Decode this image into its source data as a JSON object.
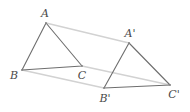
{
  "figure": {
    "background_color": "#ffffff",
    "triangle_stroke_color": "#6e6e6e",
    "vector_stroke_color": "#d2d2d2",
    "vertex_dot_color": "#8a8a8a",
    "label_color": "#4a4a4a",
    "triangle_stroke_width": 1.1,
    "vector_stroke_width": 1.4
  },
  "chart_data": {
    "type": "scatter",
    "xlabel": "",
    "ylabel": "",
    "xlim": [
      0,
      190
    ],
    "ylim": [
      0,
      112
    ],
    "grid": false,
    "legend": "none",
    "series": [
      {
        "name": "Triangle ABC",
        "points": [
          {
            "label": "A",
            "x": 46,
            "y": 23
          },
          {
            "label": "B",
            "x": 22,
            "y": 70
          },
          {
            "label": "C",
            "x": 82,
            "y": 66
          }
        ]
      },
      {
        "name": "Triangle A'B'C'",
        "points": [
          {
            "label": "A'",
            "x": 129,
            "y": 43
          },
          {
            "label": "B'",
            "x": 104,
            "y": 88
          },
          {
            "label": "C'",
            "x": 170,
            "y": 85
          }
        ]
      }
    ],
    "annotations": [
      {
        "name": "translation-vector-A",
        "from": "A",
        "to": "A'"
      },
      {
        "name": "translation-vector-B",
        "from": "B",
        "to": "B'"
      },
      {
        "name": "translation-vector-C",
        "from": "C",
        "to": "C'"
      }
    ]
  },
  "labels": {
    "a": "A",
    "b": "B",
    "c": "C",
    "a_prime": "A'",
    "b_prime": "B'",
    "c_prime": "C'"
  },
  "label_positions": {
    "a": {
      "x": 45,
      "y": 13
    },
    "b": {
      "x": 14,
      "y": 75
    },
    "c": {
      "x": 82,
      "y": 75
    },
    "a_prime": {
      "x": 130,
      "y": 33
    },
    "b_prime": {
      "x": 105,
      "y": 98
    },
    "c_prime": {
      "x": 174,
      "y": 94
    }
  },
  "geometry": {
    "triangle1": {
      "name": "ABC",
      "points": "46,23 22,70 82,66"
    },
    "triangle2": {
      "name": "A'B'C'",
      "points": "129,43 104,88 170,85"
    },
    "vectors": [
      {
        "name": "A-to-A-prime",
        "x1": 46,
        "y1": 23,
        "x2": 129,
        "y2": 43
      },
      {
        "name": "B-to-B-prime",
        "x1": 22,
        "y1": 70,
        "x2": 104,
        "y2": 88
      },
      {
        "name": "C-to-C-prime",
        "x1": 82,
        "y1": 66,
        "x2": 170,
        "y2": 85
      }
    ]
  }
}
